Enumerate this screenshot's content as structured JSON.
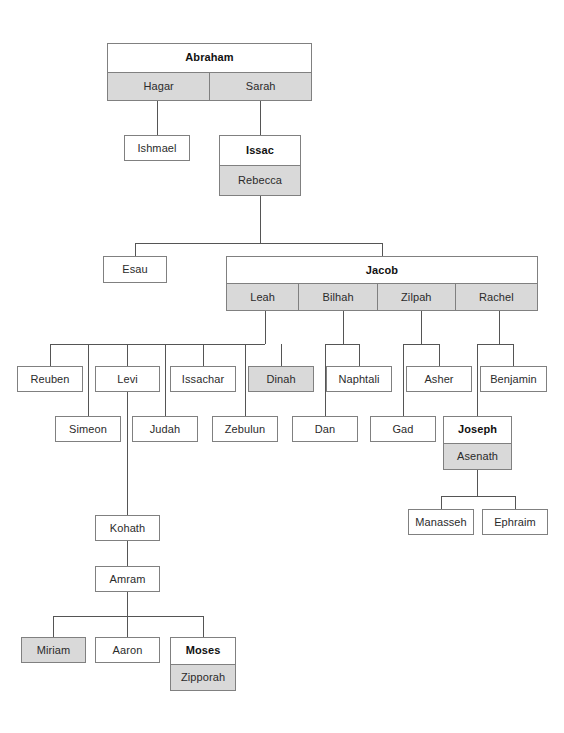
{
  "diagram": {
    "colors": {
      "box_border": "#808080",
      "box_fill": "#ffffff",
      "spouse_fill": "#d9d9d9",
      "highlight_fill": "#d9d9d9",
      "connector": "#555555",
      "text": "#2b2b2b"
    },
    "nodes": {
      "abraham": {
        "label": "Abraham",
        "bold": true
      },
      "hagar": {
        "label": "Hagar"
      },
      "sarah": {
        "label": "Sarah"
      },
      "ishmael": {
        "label": "Ishmael"
      },
      "issac": {
        "label": "Issac",
        "bold": true
      },
      "rebecca": {
        "label": "Rebecca"
      },
      "esau": {
        "label": "Esau"
      },
      "jacob": {
        "label": "Jacob",
        "bold": true
      },
      "leah": {
        "label": "Leah"
      },
      "bilhah": {
        "label": "Bilhah"
      },
      "zilpah": {
        "label": "Zilpah"
      },
      "rachel": {
        "label": "Rachel"
      },
      "reuben": {
        "label": "Reuben"
      },
      "levi": {
        "label": "Levi"
      },
      "issachar": {
        "label": "Issachar"
      },
      "dinah": {
        "label": "Dinah",
        "highlight": true
      },
      "naphtali": {
        "label": "Naphtali"
      },
      "asher": {
        "label": "Asher"
      },
      "benjamin": {
        "label": "Benjamin"
      },
      "simeon": {
        "label": "Simeon"
      },
      "judah": {
        "label": "Judah"
      },
      "zebulun": {
        "label": "Zebulun"
      },
      "dan": {
        "label": "Dan"
      },
      "gad": {
        "label": "Gad"
      },
      "joseph": {
        "label": "Joseph",
        "bold": true
      },
      "asenath": {
        "label": "Asenath"
      },
      "manasseh": {
        "label": "Manasseh"
      },
      "ephraim": {
        "label": "Ephraim"
      },
      "kohath": {
        "label": "Kohath"
      },
      "amram": {
        "label": "Amram"
      },
      "miriam": {
        "label": "Miriam",
        "highlight": true
      },
      "aaron": {
        "label": "Aaron"
      },
      "moses": {
        "label": "Moses",
        "bold": true
      },
      "zipporah": {
        "label": "Zipporah"
      }
    }
  }
}
